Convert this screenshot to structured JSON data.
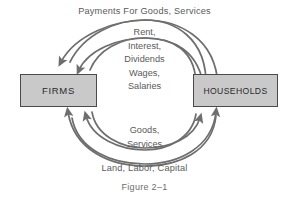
{
  "figure": {
    "caption": "Figure 2–1",
    "nodes": {
      "firms": "FIRMS",
      "households": "HOUSEHOLDS"
    },
    "flows": {
      "top_outer": "Payments For Goods, Services",
      "top_inner": [
        "Rent,",
        "Interest,",
        "Dividends",
        "Wages,",
        "Salaries"
      ],
      "bottom_inner": [
        "Goods,",
        "Services"
      ],
      "bottom_outer": "Land, Labor, Capital"
    },
    "colors": {
      "box_fill": "#c9c9c9",
      "box_border": "#4a4a4a",
      "arrow": "#6e6e6e",
      "text": "#5a5a5a",
      "background": "#ffffff"
    }
  }
}
